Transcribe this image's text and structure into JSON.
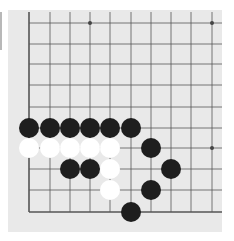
{
  "board": {
    "background": "#e9e9e9",
    "line_color": "#555555",
    "columns_x": [
      29,
      50,
      70,
      90,
      110,
      131,
      151,
      171,
      191,
      212
    ],
    "rows_y": [
      23,
      44,
      64,
      85,
      107,
      128,
      148,
      169,
      190,
      212
    ],
    "edges": [
      "left",
      "bottom"
    ],
    "star_points": [
      [
        3,
        0
      ],
      [
        9,
        0
      ],
      [
        9,
        6
      ],
      [
        3,
        6
      ]
    ],
    "stone_radius": 10
  },
  "stones": {
    "black": [
      [
        0,
        5
      ],
      [
        1,
        5
      ],
      [
        2,
        5
      ],
      [
        3,
        5
      ],
      [
        4,
        5
      ],
      [
        5,
        5
      ],
      [
        2,
        7
      ],
      [
        3,
        7
      ],
      [
        6,
        6
      ],
      [
        7,
        7
      ],
      [
        6,
        8
      ],
      [
        5,
        9
      ]
    ],
    "white": [
      [
        0,
        6
      ],
      [
        1,
        6
      ],
      [
        2,
        6
      ],
      [
        3,
        6
      ],
      [
        4,
        6
      ],
      [
        4,
        7
      ],
      [
        4,
        8
      ]
    ]
  },
  "colors": {
    "black_stone": "#1e1e1e",
    "white_stone": "#ffffff"
  }
}
